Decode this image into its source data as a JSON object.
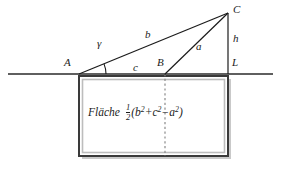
{
  "figure": {
    "background_color": "#ffffff",
    "line_color": "#1b1b1b",
    "rect_border_color": "#3a3a3a",
    "rect_inner_border_color": "#b9b9b9",
    "rect_fill_color": "#ffffff",
    "dashed_line_color": "#8a8a8a"
  },
  "labels": {
    "vertex_A": "A",
    "vertex_B": "B",
    "vertex_C": "C",
    "point_L": "L",
    "side_b": "b",
    "side_c": "c",
    "side_a": "a",
    "height_h": "h",
    "angle_gamma": "γ"
  },
  "area_formula": {
    "word": "Fläche",
    "fraction_numerator": "1",
    "fraction_denominator": "2",
    "open_paren": "(",
    "term_b": "b",
    "term_b_exp": "2",
    "plus": "+",
    "term_c": "c",
    "term_c_exp": "2",
    "minus": "−",
    "term_a": "a",
    "term_a_exp": "2",
    "close_paren": ")"
  },
  "geometry": {
    "baseline": {
      "x1": 8,
      "y1": 74,
      "x2": 273,
      "y2": 74
    },
    "point_A": {
      "x": 79,
      "y": 74
    },
    "point_B": {
      "x": 165,
      "y": 74
    },
    "point_C": {
      "x": 228,
      "y": 13
    },
    "point_L": {
      "x": 228,
      "y": 74
    },
    "rectangle": {
      "x": 79,
      "y": 76,
      "width": 149,
      "height": 80
    },
    "dashed_divider": {
      "x": 165,
      "y1": 76,
      "y2": 156
    },
    "angle_arc_radius": 27
  }
}
